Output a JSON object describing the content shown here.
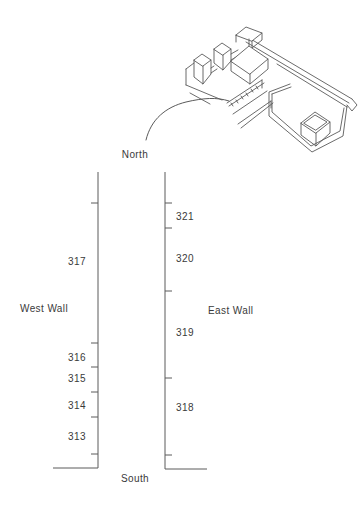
{
  "colors": {
    "background": "#ffffff",
    "line": "#5a5a5a",
    "text": "#3a3a3a"
  },
  "icons": {
    "inset": "isometric-structure-drawing",
    "leader": "curved-leader-line"
  },
  "compass": {
    "north": "North",
    "south": "South"
  },
  "west_wall": {
    "label": "West Wall",
    "units": [
      "317",
      "316",
      "315",
      "314",
      "313"
    ]
  },
  "east_wall": {
    "label": "East Wall",
    "units": [
      "321",
      "320",
      "319",
      "318"
    ]
  }
}
